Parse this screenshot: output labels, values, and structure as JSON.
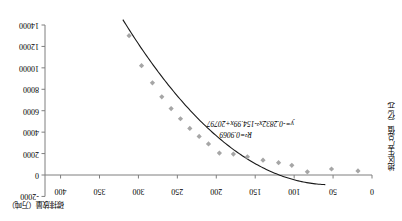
{
  "chart_data": {
    "type": "scatter",
    "title": "",
    "subtitle": "",
    "orientation": "rotated-180",
    "xlabel": "碳排放量（万吨）",
    "ylabel": "地区生产总值（亿元）",
    "xlim": [
      0,
      420
    ],
    "ylim": [
      -2000,
      14000
    ],
    "xticks": [
      0,
      50,
      100,
      150,
      200,
      250,
      300,
      350,
      400
    ],
    "xtick_labels": [
      "0",
      "50",
      "100",
      "150",
      "200",
      "250",
      "300",
      "350",
      "400"
    ],
    "yticks": [
      -2000,
      0,
      2000,
      4000,
      6000,
      8000,
      10000,
      12000,
      14000
    ],
    "ytick_labels": [
      "-2000",
      "0",
      "2000",
      "4000",
      "6000",
      "8000",
      "10000",
      "12000",
      "14000"
    ],
    "grid": false,
    "legend": "none",
    "marker_shape": "diamond",
    "marker_color": "#a6a6a6",
    "curve_color": "#1a1a1a",
    "axis_color": "#7f7f7f",
    "series": [
      {
        "name": "地区生产总值",
        "points": [
          {
            "x": 18,
            "y": 380
          },
          {
            "x": 52,
            "y": 560
          },
          {
            "x": 83,
            "y": 300
          },
          {
            "x": 103,
            "y": 900
          },
          {
            "x": 120,
            "y": 1150
          },
          {
            "x": 140,
            "y": 1380
          },
          {
            "x": 160,
            "y": 1700
          },
          {
            "x": 178,
            "y": 1950
          },
          {
            "x": 196,
            "y": 2050
          },
          {
            "x": 210,
            "y": 2900
          },
          {
            "x": 222,
            "y": 3600
          },
          {
            "x": 234,
            "y": 4350
          },
          {
            "x": 246,
            "y": 5250
          },
          {
            "x": 258,
            "y": 6200
          },
          {
            "x": 270,
            "y": 7300
          },
          {
            "x": 282,
            "y": 8600
          },
          {
            "x": 296,
            "y": 10200
          },
          {
            "x": 312,
            "y": 13000
          }
        ]
      }
    ],
    "fit_curve": {
      "equation_label": "y=-0.2832x²-154.99x+20797",
      "r_squared_label": "R²=0.9069",
      "a": -0.2832,
      "b": -154.99,
      "c": 20797,
      "r_squared": 0.9069,
      "x_start": 60,
      "x_end": 320
    },
    "annotations": [
      {
        "name": "regression-equation",
        "text": "y=-0.2832x²-154.99x+20797"
      },
      {
        "name": "r-squared",
        "text": "R²=0.9069"
      }
    ]
  }
}
